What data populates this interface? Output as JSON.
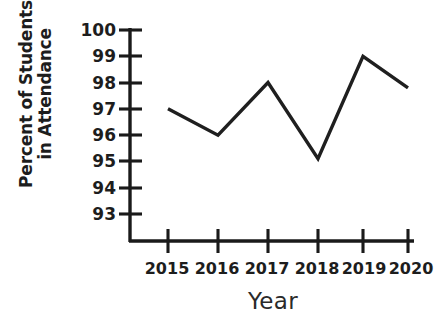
{
  "chart_data": {
    "type": "line",
    "title": "",
    "xlabel": "Year",
    "ylabel": "Percent of Students in Attendance",
    "ylabel_lines": [
      "Percent of Students",
      "in Attendance"
    ],
    "categories": [
      "2015",
      "2016",
      "2017",
      "2018",
      "2019",
      "2020"
    ],
    "x": [
      2015,
      2016,
      2017,
      2018,
      2019,
      2020
    ],
    "values": [
      97,
      96,
      98,
      95.1,
      99,
      97.8
    ],
    "series": [
      {
        "name": "Percent of Students in Attendance",
        "values": [
          97,
          96,
          98,
          95.1,
          99,
          97.8
        ]
      }
    ],
    "ylim": [
      93,
      100
    ],
    "ytick_labels": [
      "100",
      "99",
      "98",
      "97",
      "96",
      "95",
      "94",
      "93"
    ],
    "ytick_values": [
      100,
      99,
      98,
      97,
      96,
      95,
      94,
      93
    ],
    "xtick_labels": [
      "2015",
      "2016",
      "2017",
      "2018",
      "2019",
      "2020"
    ],
    "grid": false,
    "legend": false,
    "legend_position": "none",
    "axis_broken": true,
    "line_color": "#1f1f1f",
    "axis_color": "#1a1a1a",
    "background_color": "#ffffff",
    "markers": false
  }
}
